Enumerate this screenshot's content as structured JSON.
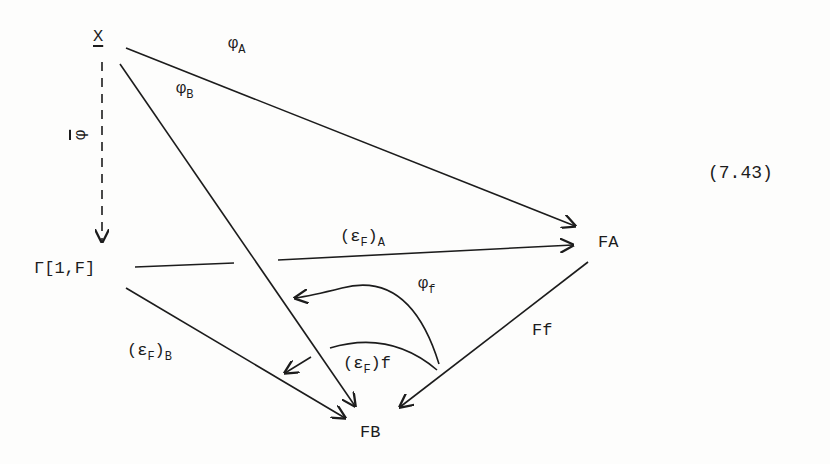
{
  "equation_number": "(7.43)",
  "objects": {
    "X": "X",
    "Gamma": "Γ[1,F]",
    "FA": "FA",
    "FB": "FB"
  },
  "morphisms": {
    "phi_bar": {
      "symbol": "φ",
      "from": "X",
      "to": "Γ[1,F]",
      "style": "dashed"
    },
    "phi_A": {
      "symbol": "φ",
      "sub": "A",
      "from": "X",
      "to": "FA"
    },
    "phi_B": {
      "symbol": "φ",
      "sub": "B",
      "from": "X",
      "to": "FB"
    },
    "eps_A": {
      "open": "(",
      "symbol": "ε",
      "inner_sub": "F",
      "close": ")",
      "sub": "A",
      "from": "Γ[1,F]",
      "to": "FA"
    },
    "eps_B": {
      "open": "(",
      "symbol": "ε",
      "inner_sub": "F",
      "close": ")",
      "sub": "B",
      "from": "Γ[1,F]",
      "to": "FB"
    },
    "Ff": {
      "label": "Ff",
      "from": "FA",
      "to": "FB"
    },
    "phi_f": {
      "symbol": "φ",
      "sub": "f",
      "type": "2-cell"
    },
    "eps_f": {
      "open": "(",
      "symbol": "ε",
      "inner_sub": "F",
      "close": ")",
      "sub": "f",
      "type": "2-cell"
    }
  },
  "colors": {
    "ink": "#1c1c1c",
    "paper": "#fdfdfc"
  }
}
